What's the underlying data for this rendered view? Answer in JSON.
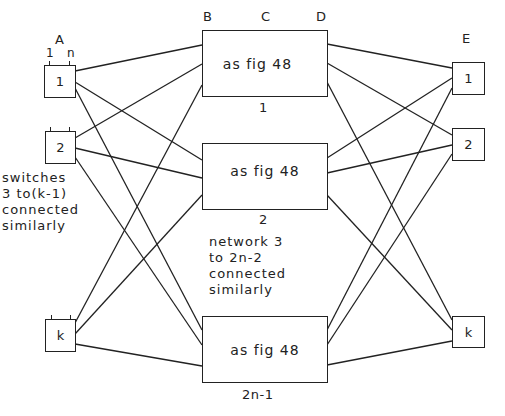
{
  "stage_labels": {
    "A": "A",
    "B": "B",
    "C": "C",
    "D": "D",
    "E": "E"
  },
  "input_pins": {
    "first": "1",
    "last": "n"
  },
  "left_switches": [
    {
      "label": "1"
    },
    {
      "label": "2"
    },
    {
      "label": "k"
    }
  ],
  "middle_networks": [
    {
      "text": "as fig 48",
      "caption": "1"
    },
    {
      "text": "as fig 48",
      "caption": "2"
    },
    {
      "text": "as fig 48",
      "caption": "2n-1"
    }
  ],
  "right_switches": [
    {
      "label": "1"
    },
    {
      "label": "2"
    },
    {
      "label": "k"
    }
  ],
  "notes": {
    "left": [
      "switches",
      "3 to(k-1)",
      "connected",
      "similarly"
    ],
    "middle": [
      "network 3",
      "to 2n-2",
      "connected",
      "similarly"
    ]
  },
  "colors": {
    "line": "#222222",
    "background": "#ffffff"
  }
}
